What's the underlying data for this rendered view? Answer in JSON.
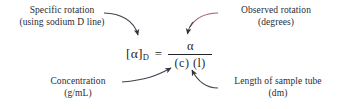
{
  "figure": {
    "background_color": "#ffffff",
    "text_color": "#2b2b35",
    "leader_dark_color": "#3b3b4a",
    "leader_accent_color": "#9d5f6b"
  },
  "equation": {
    "lhs_symbol": "[α]",
    "lhs_subscript": "D",
    "equals": "=",
    "numerator": "α",
    "denominator": "(c) (l)"
  },
  "callouts": {
    "specific_rotation": {
      "line1": "Specific rotation",
      "line2": "(using sodium D line)"
    },
    "observed_rotation": {
      "line1": "Observed rotation",
      "line2": "(degrees)"
    },
    "concentration": {
      "line1": "Concentration",
      "line2": "(g/mL)"
    },
    "length_of_sample_tube": {
      "line1": "Length of sample tube",
      "line2": "(dm)"
    }
  }
}
